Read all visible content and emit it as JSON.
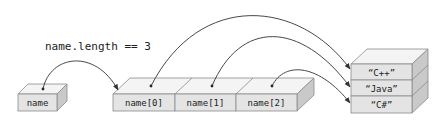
{
  "caption": "name.length == 3",
  "variable": {
    "label": "name"
  },
  "array": {
    "cells": [
      {
        "label": "name[0]"
      },
      {
        "label": "name[1]"
      },
      {
        "label": "name[2]"
      }
    ]
  },
  "strings": [
    {
      "label": "“C++”"
    },
    {
      "label": "“Java”"
    },
    {
      "label": "“C#”"
    }
  ],
  "references": [
    {
      "from": "name",
      "to": "array"
    },
    {
      "from": "name[0]",
      "to": "“C++”"
    },
    {
      "from": "name[1]",
      "to": "“Java”"
    },
    {
      "from": "name[2]",
      "to": "“C#”"
    }
  ],
  "colors": {
    "front": "#e4e4e4",
    "top": "#f4f4f4",
    "side": "#c9c9c9",
    "stroke": "#8a8a8a",
    "arrow": "#333333"
  }
}
